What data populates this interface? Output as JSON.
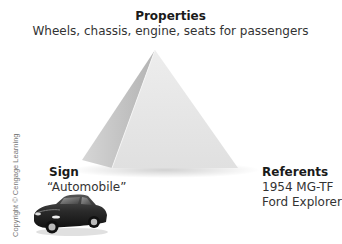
{
  "diagram": {
    "type": "semiotic-triangle",
    "properties": {
      "title": "Properties",
      "text": "Wheels, chassis, engine, seats for passengers"
    },
    "sign": {
      "title": "Sign",
      "text": "“Automobile”",
      "icon": "car-icon"
    },
    "referents": {
      "title": "Referents",
      "items": [
        "1954 MG-TF",
        "Ford Explorer"
      ]
    },
    "copyright": "Copyright © Cengage Learning",
    "colors": {
      "pyramid_front": "#e6e6e6",
      "pyramid_side": "#bdbdbd",
      "car_body": "#2a2a2a"
    }
  }
}
